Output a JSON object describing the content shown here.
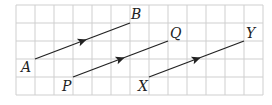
{
  "diagram": {
    "type": "vector-grid",
    "grid": {
      "x0": 16,
      "y0": 5,
      "cols": 13,
      "rows": 5,
      "cell_w": 19,
      "cell_h": 18,
      "color": "#cfcfcf"
    },
    "vectors": [
      {
        "name": "AB",
        "from": "A",
        "to": "B",
        "x1": 35,
        "y1": 59,
        "x2": 130,
        "y2": 23
      },
      {
        "name": "PQ",
        "from": "P",
        "to": "Q",
        "x1": 73,
        "y1": 77,
        "x2": 168,
        "y2": 41
      },
      {
        "name": "XY",
        "from": "X",
        "to": "Y",
        "x1": 149,
        "y1": 77,
        "x2": 244,
        "y2": 41
      }
    ],
    "labels": {
      "A": "A",
      "B": "B",
      "P": "P",
      "Q": "Q",
      "X": "X",
      "Y": "Y"
    },
    "line_color": "#222222"
  }
}
